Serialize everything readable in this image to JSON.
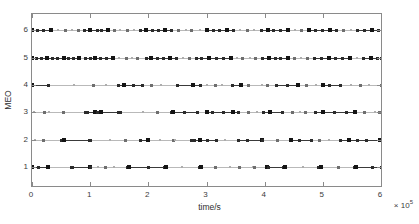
{
  "chart_data": {
    "type": "scatter",
    "title": "",
    "xlabel": "time/s",
    "ylabel": "MEO",
    "x_exponent_label": "× 10",
    "x_exponent_power": "5",
    "xlim": [
      0,
      600000
    ],
    "ylim": [
      0.3,
      6.6
    ],
    "xticks": [
      0,
      100000,
      200000,
      300000,
      400000,
      500000,
      600000
    ],
    "xtick_labels": [
      "0",
      "1",
      "2",
      "3",
      "4",
      "5",
      "6"
    ],
    "yticks": [
      1,
      2,
      3,
      4,
      5,
      6
    ],
    "ytick_labels": [
      "1",
      "2",
      "3",
      "4",
      "5",
      "6"
    ],
    "grid": false,
    "legend": null,
    "x_scale_factor": 100000,
    "marker": "square",
    "line_style": "solid",
    "series": [
      {
        "name": "MEO 1",
        "y": 1,
        "events": [
          0,
          12000,
          26000,
          27000,
          68000,
          70000,
          99000,
          101000,
          113000,
          126000,
          141000,
          165000,
          167000,
          200000,
          228000,
          231000,
          258000,
          288000,
          291000,
          315000,
          341000,
          357000,
          380000,
          382000,
          404000,
          406000,
          432000,
          435000,
          466000,
          493000,
          496000,
          527000,
          554000,
          557000,
          585000,
          600000
        ],
        "intervals": [
          [
            0,
            27000
          ],
          [
            68000,
            101000
          ],
          [
            165000,
            231000
          ],
          [
            288000,
            291000
          ],
          [
            404000,
            435000
          ],
          [
            493000,
            496000
          ],
          [
            554000,
            600000
          ]
        ]
      },
      {
        "name": "MEO 2",
        "y": 2,
        "events": [
          6000,
          19000,
          50000,
          55000,
          98000,
          101000,
          134000,
          160000,
          186000,
          199000,
          220000,
          243000,
          245000,
          275000,
          280000,
          288000,
          302000,
          318000,
          331000,
          355000,
          371000,
          395000,
          397000,
          422000,
          446000,
          460000,
          480000,
          495000,
          510000,
          530000,
          545000,
          560000,
          575000,
          598000
        ],
        "intervals": [
          [
            50000,
            101000
          ],
          [
            186000,
            199000
          ],
          [
            275000,
            318000
          ],
          [
            355000,
            397000
          ],
          [
            446000,
            480000
          ],
          [
            530000,
            598000
          ]
        ]
      },
      {
        "name": "MEO 3",
        "y": 3,
        "events": [
          3000,
          22000,
          30000,
          55000,
          92000,
          96000,
          108000,
          112000,
          116000,
          118000,
          148000,
          152000,
          190000,
          215000,
          240000,
          243000,
          262000,
          285000,
          300000,
          310000,
          330000,
          345000,
          355000,
          372000,
          386000,
          398000,
          408000,
          410000,
          430000,
          448000,
          460000,
          470000,
          488000,
          500000,
          520000,
          540000,
          555000,
          572000,
          590000,
          598000
        ],
        "intervals": [
          [
            92000,
            152000
          ],
          [
            240000,
            285000
          ],
          [
            300000,
            355000
          ],
          [
            398000,
            430000
          ],
          [
            488000,
            555000
          ]
        ]
      },
      {
        "name": "MEO 4",
        "y": 4,
        "events": [
          0,
          28000,
          72000,
          105000,
          128000,
          148000,
          158000,
          175000,
          190000,
          205000,
          222000,
          250000,
          276000,
          290000,
          300000,
          315000,
          327000,
          345000,
          360000,
          372000,
          396000,
          405000,
          420000,
          440000,
          457000,
          472000,
          488000,
          500000,
          512000,
          530000,
          548000,
          565000,
          580000,
          600000
        ],
        "intervals": [
          [
            0,
            28000
          ],
          [
            148000,
            190000
          ],
          [
            250000,
            290000
          ],
          [
            345000,
            360000
          ],
          [
            420000,
            457000
          ],
          [
            500000,
            530000
          ]
        ]
      },
      {
        "name": "MEO 5",
        "y": 5,
        "events": [
          0,
          8000,
          16000,
          26000,
          36000,
          44000,
          55000,
          62000,
          72000,
          80000,
          92000,
          100000,
          108000,
          118000,
          128000,
          140000,
          150000,
          162000,
          172000,
          182000,
          196000,
          205000,
          215000,
          226000,
          238000,
          248000,
          260000,
          270000,
          282000,
          292000,
          305000,
          318000,
          330000,
          342000,
          352000,
          362000,
          374000,
          385000,
          396000,
          408000,
          418000,
          428000,
          440000,
          452000,
          462000,
          474000,
          486000,
          498000,
          510000,
          522000,
          534000,
          546000,
          558000,
          570000,
          582000,
          594000,
          600000
        ],
        "intervals": [
          [
            0,
            80000
          ],
          [
            92000,
            140000
          ],
          [
            196000,
            248000
          ],
          [
            282000,
            342000
          ],
          [
            396000,
            440000
          ],
          [
            486000,
            546000
          ],
          [
            570000,
            600000
          ]
        ]
      },
      {
        "name": "MEO 6",
        "y": 6,
        "events": [
          0,
          10000,
          20000,
          32000,
          45000,
          58000,
          68000,
          80000,
          90000,
          100000,
          112000,
          120000,
          130000,
          142000,
          152000,
          165000,
          175000,
          186000,
          196000,
          208000,
          218000,
          228000,
          240000,
          252000,
          264000,
          275000,
          288000,
          300000,
          312000,
          322000,
          335000,
          346000,
          358000,
          370000,
          382000,
          394000,
          405000,
          416000,
          428000,
          440000,
          452000,
          464000,
          476000,
          488000,
          500000,
          512000,
          524000,
          536000,
          548000,
          560000,
          572000,
          584000,
          596000
        ],
        "intervals": [
          [
            0,
            32000
          ],
          [
            90000,
            130000
          ],
          [
            186000,
            240000
          ],
          [
            300000,
            346000
          ],
          [
            394000,
            440000
          ],
          [
            476000,
            524000
          ],
          [
            560000,
            596000
          ]
        ]
      }
    ]
  },
  "axes": {
    "xlabel": "time/s",
    "ylabel": "MEO",
    "exponent_prefix": "× 10",
    "exponent_power": "5"
  }
}
